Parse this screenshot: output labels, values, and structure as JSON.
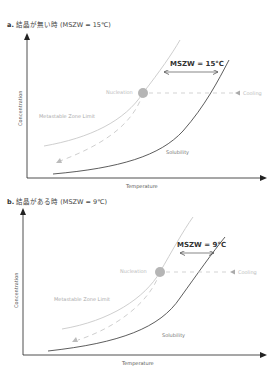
{
  "top_cut_text": "……………………………………（Metastable Zone Width）…………………………",
  "panels": [
    {
      "letter": "a.",
      "title": "結晶が無い時 (MSZW = 15℃)",
      "mszw_label": "MSZW = 15°C",
      "nucleation_label": "Nucleation",
      "cooling_label": "Cooling",
      "mzl_label": "Metastable Zone Limit",
      "solubility_label": "Solubility",
      "x_axis_label": "Temperature",
      "y_axis_label": "Concentration"
    },
    {
      "letter": "b.",
      "title": "結晶がある時 (MSZW = 9℃)",
      "mszw_label": "MSZW = 9°C",
      "nucleation_label": "Nucleation",
      "cooling_label": "Cooling",
      "mzl_label": "Metastable Zone Limit",
      "solubility_label": "Solubility",
      "x_axis_label": "Temperature",
      "y_axis_label": "Concentration"
    }
  ],
  "colors": {
    "axis": "#222222",
    "solubility_curve": "#333333",
    "mzl_curve": "#c8c8c8",
    "dashed_path": "#c8c8c8",
    "nucleation_dot": "#b5b5b5",
    "faint_text": "#b0b0b0",
    "mszw_text": "#333333"
  }
}
